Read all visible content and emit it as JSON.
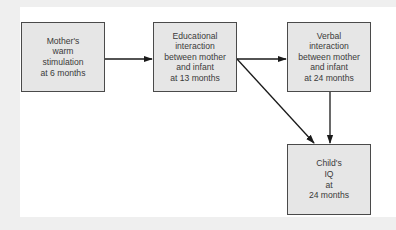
{
  "diagram": {
    "type": "path-diagram",
    "nodes": [
      {
        "id": "n1",
        "label": "Mother's\nwarm\nstimulation\nat 6 months"
      },
      {
        "id": "n2",
        "label": "Educational\ninteraction\nbetween mother\nand infant\nat 13 months"
      },
      {
        "id": "n3",
        "label": "Verbal\ninteraction\nbetween mother\nand infant\nat 24 months"
      },
      {
        "id": "n4",
        "label": "Child's\nIQ\nat\n24 months"
      }
    ],
    "edges": [
      {
        "from": "n1",
        "to": "n2"
      },
      {
        "from": "n2",
        "to": "n3"
      },
      {
        "from": "n2",
        "to": "n4"
      },
      {
        "from": "n3",
        "to": "n4"
      }
    ],
    "colors": {
      "node_fill": "#e6e6e6",
      "node_border": "#4a4a4a",
      "edge": "#1a1a1a",
      "panel": "#ffffff",
      "background": "#efefef"
    }
  }
}
